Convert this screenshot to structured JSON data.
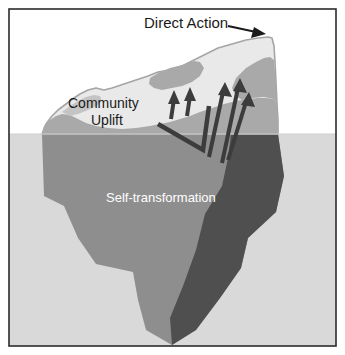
{
  "figure": {
    "type": "iceberg-diagram",
    "frame": {
      "border_color": "#2b2b2b",
      "background_color": "#ffffff"
    },
    "waterline": {
      "y": 134,
      "sky_color": "#ffffff",
      "water_color": "#d9d9d9"
    },
    "colors": {
      "ice_light": "#e8e8e8",
      "ice_mid": "#a8a8a8",
      "ice_dark": "#6e6e6e",
      "ice_shadow": "#4a4a4a",
      "outline": "#9a9a9a",
      "arrow": "#3c3c3c",
      "text_dark": "#1a1a1a",
      "text_light": "#ffffff"
    },
    "labels": [
      {
        "id": "direct-action",
        "text": "Direct Action",
        "position": "above-water-top",
        "color": "#1a1a1a",
        "font_size": 15,
        "has_pointer_arrow": true
      },
      {
        "id": "community-uplift",
        "line1": "Community",
        "line2": "Uplift",
        "position": "above-water-left",
        "color": "#1a1a1a",
        "font_size": 14
      },
      {
        "id": "self-transformation",
        "text": "Self-transformation",
        "position": "below-water-center",
        "color": "#ffffff",
        "font_size": 13
      }
    ],
    "arrows": {
      "count": 5,
      "direction": "upward",
      "short_arrows": 2,
      "long_arrows": 3,
      "has_chevron_baseline": true,
      "color": "#3c3c3c"
    }
  }
}
